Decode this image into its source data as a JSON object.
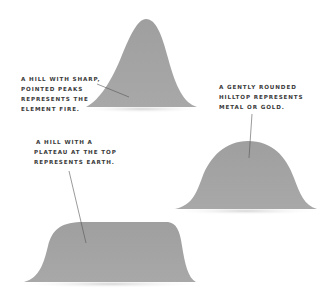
{
  "colors": {
    "hill_fill": "#a3a3a3",
    "hill_shadow": "#d8d8d8",
    "text": "#3a3a3a",
    "leader_line": "#555555",
    "background": "#ffffff"
  },
  "annotations": {
    "fire": {
      "lines": [
        "A hill with sharp,",
        "pointed peaks",
        "represents the",
        "element fire."
      ]
    },
    "metal": {
      "lines": [
        "A gently rounded",
        "hilltop represents",
        "metal or gold."
      ]
    },
    "earth": {
      "lines": [
        "A hill with a",
        "plateau at the top",
        "represents earth."
      ]
    }
  }
}
